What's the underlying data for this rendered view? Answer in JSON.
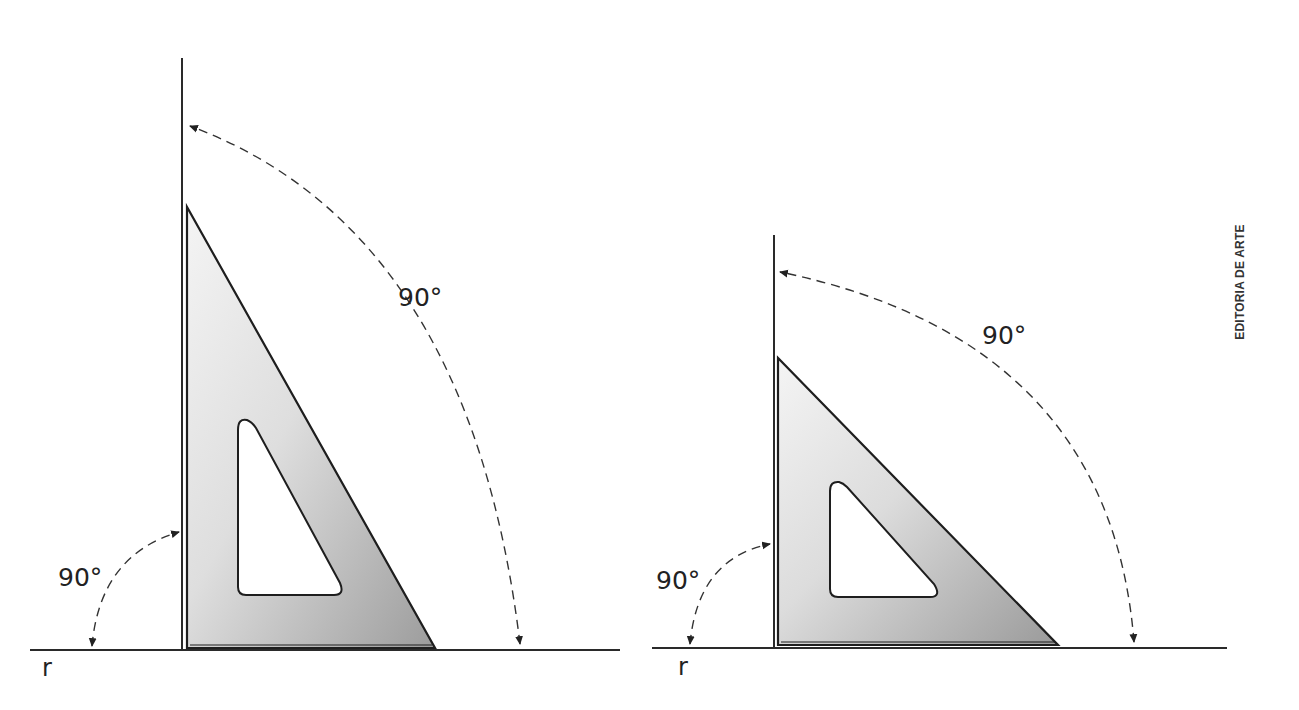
{
  "figures": [
    {
      "id": "left",
      "line_label": "r",
      "angle_labels": {
        "small_arc": "90°",
        "large_arc": "90°"
      }
    },
    {
      "id": "right",
      "line_label": "r",
      "angle_labels": {
        "small_arc": "90°",
        "large_arc": "90°"
      }
    }
  ],
  "credit": "EDITORIA DE ARTE",
  "colors": {
    "line": "#2a2a2a",
    "square_light": "#f2f2f2",
    "square_dark": "#9a9a9a",
    "background": "#ffffff"
  }
}
